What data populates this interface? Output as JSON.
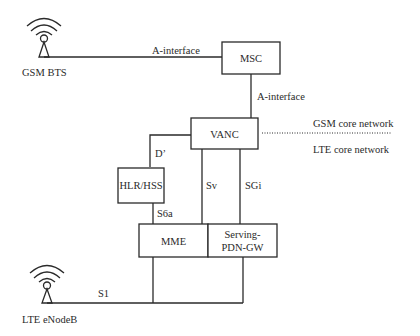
{
  "diagram": {
    "nodes": {
      "gsm_bts": {
        "label": "GSM BTS"
      },
      "msc": {
        "label": "MSC"
      },
      "vanc": {
        "label": "VANC"
      },
      "hlr_hss": {
        "label": "HLR/HSS"
      },
      "mme": {
        "label": "MME"
      },
      "serving_pdn_gw": {
        "label_line1": "Serving-",
        "label_line2": "PDN-GW"
      },
      "lte_enodeb": {
        "label": "LTE eNodeB"
      }
    },
    "interfaces": {
      "bts_msc": "A-interface",
      "msc_vanc": "A-interface",
      "vanc_hlr": "D’",
      "vanc_mme": "Sv",
      "vanc_gw": "SGi",
      "hlr_mme": "S6a",
      "enodeb_core": "S1"
    },
    "domains": {
      "upper": "GSM core network",
      "lower": "LTE core network"
    },
    "colors": {
      "stroke": "#2a2a2a",
      "background": "#ffffff"
    }
  }
}
